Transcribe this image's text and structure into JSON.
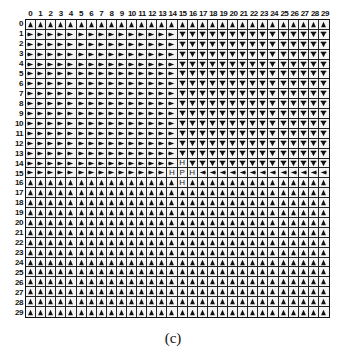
{
  "figure": {
    "caption": "(c)",
    "columns": [
      "0",
      "1",
      "2",
      "3",
      "4",
      "5",
      "6",
      "7",
      "8",
      "9",
      "10",
      "11",
      "12",
      "13",
      "14",
      "15",
      "16",
      "17",
      "18",
      "19",
      "20",
      "21",
      "22",
      "23",
      "24",
      "25",
      "26",
      "27",
      "28",
      "29"
    ],
    "rows": [
      "0",
      "1",
      "2",
      "3",
      "4",
      "5",
      "6",
      "7",
      "8",
      "9",
      "10",
      "11",
      "12",
      "13",
      "14",
      "15",
      "16",
      "17",
      "18",
      "19",
      "20",
      "21",
      "22",
      "23",
      "24",
      "25",
      "26",
      "27",
      "28",
      "29"
    ],
    "legend": {
      "U": "up-triangle",
      "R": "right-arrow",
      "D": "down-arrow",
      "L": "left-arrow",
      "H": "H",
      "P": "P"
    },
    "grid": [
      "UUUUUUUUUUUUUUUUUUUUUUUUUUUUUU",
      "RRRRRRRRRRRRRRRDDDDDDDDDDDDDDD",
      "RRRRRRRRRRRRRRRDDDDDDDDDDDDDDD",
      "RRRRRRRRRRRRRRRDDDDDDDDDDDDDDD",
      "RRRRRRRRRRRRRRRDDDDDDDDDDDDDDD",
      "RRRRRRRRRRRRRRRDDDDDDDDDDDDDDD",
      "RRRRRRRRRRRRRRRDDDDDDDDDDDDDDD",
      "RRRRRRRRRRRRRRRDDDDDDDDDDDDDDD",
      "RRRRRRRRRRRRRRRDDDDDDDDDDDDDDD",
      "RRRRRRRRRRRRRRRDDDDDDDDDDDDDDD",
      "RRRRRRRRRRRRRRRDDDDDDDDDDDDDDD",
      "RRRRRRRRRRRRRRRDDDDDDDDDDDDDDD",
      "RRRRRRRRRRRRRRRDDDDDDDDDDDDDDD",
      "RRRRRRRRRRRRRRRDDDDDDDDDDDDDDD",
      "RRRRRRRRRRRRRRRHDDDDDDDDDDDDDD",
      "RRRRRRRRRRRRRRHPHLLLLLLLLLLLLL",
      "UUUUUUUUUUUUUUUHUUUUUUUUUUUUUU",
      "UUUUUUUUUUUUUUUUUUUUUUUUUUUUUU",
      "UUUUUUUUUUUUUUUUUUUUUUUUUUUUUU",
      "UUUUUUUUUUUUUUUUUUUUUUUUUUUUUU",
      "UUUUUUUUUUUUUUUUUUUUUUUUUUUUUU",
      "UUUUUUUUUUUUUUUUUUUUUUUUUUUUUU",
      "UUUUUUUUUUUUUUUUUUUUUUUUUUUUUU",
      "UUUUUUUUUUUUUUUUUUUUUUUUUUUUUU",
      "UUUUUUUUUUUUUUUUUUUUUUUUUUUUUU",
      "UUUUUUUUUUUUUUUUUUUUUUUUUUUUUU",
      "UUUUUUUUUUUUUUUUUUUUUUUUUUUUUU",
      "UUUUUUUUUUUUUUUUUUUUUUUUUUUUUU",
      "UUUUUUUUUUUUUUUUUUUUUUUUUUUUUU",
      "UUUUUUUUUUUUUUUUUUUUUUUUUUUUUU"
    ],
    "colors": {
      "ink": "#111111",
      "cell_bg": "#f4f4f4",
      "grid_line": "#222222"
    }
  }
}
